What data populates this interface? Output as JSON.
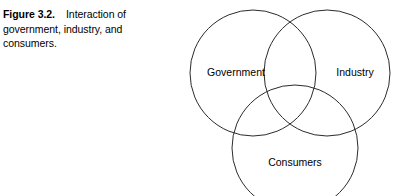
{
  "figure": {
    "caption": {
      "label": "Figure 3.2.",
      "line1_text": "Interaction of",
      "line2_text": "government, industry, and",
      "line3_text": "consumers."
    },
    "diagram": {
      "type": "venn-three-set",
      "stroke_color": "#2b2b2b",
      "background_color": "#ffffff",
      "text_color": "#000000",
      "sets": [
        {
          "name": "government",
          "label": "Government",
          "cx": 73,
          "cy": 73,
          "r": 63,
          "label_x": 56,
          "label_y": 73
        },
        {
          "name": "industry",
          "label": "Industry",
          "cx": 147,
          "cy": 73,
          "r": 63,
          "label_x": 175,
          "label_y": 73
        },
        {
          "name": "consumers",
          "label": "Consumers",
          "cx": 115,
          "cy": 148,
          "r": 63,
          "label_x": 115,
          "label_y": 163
        }
      ]
    }
  }
}
